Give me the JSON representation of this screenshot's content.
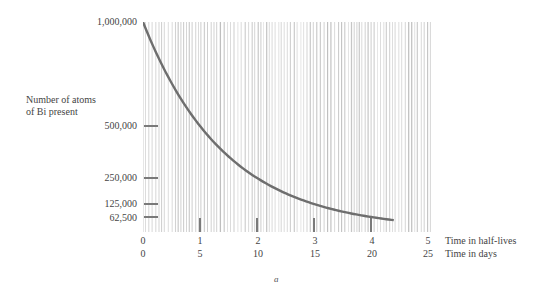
{
  "chart_data": {
    "type": "line",
    "title": "",
    "ylabel": "Number of atoms of Bi present",
    "ylabel_lines": [
      "Number of atoms",
      "of Bi present"
    ],
    "xlabel_primary": "Time in half-lives",
    "xlabel_secondary": "Time in days",
    "x_half_lives": [
      0,
      0.5,
      1,
      1.5,
      2,
      2.5,
      3,
      3.5,
      4,
      4.4
    ],
    "y_atoms": [
      1000000,
      707107,
      500000,
      353553,
      250000,
      176777,
      125000,
      88388,
      62500,
      47366
    ],
    "y_ticks": [
      {
        "value": 1000000,
        "label": "1,000,000"
      },
      {
        "value": 500000,
        "label": "500,000"
      },
      {
        "value": 250000,
        "label": "250,000"
      },
      {
        "value": 125000,
        "label": "125,000"
      },
      {
        "value": 62500,
        "label": "62,500"
      }
    ],
    "x_ticks_half_lives": [
      "0",
      "1",
      "2",
      "3",
      "4",
      "5"
    ],
    "x_ticks_days": [
      "0",
      "5",
      "10",
      "15",
      "20",
      "25"
    ],
    "xlim": [
      0,
      5
    ],
    "ylim": [
      0,
      1000000
    ],
    "grid": "vertical stripe shading",
    "legend": "none",
    "caption": "a",
    "colors": {
      "curve": "#6e6e6e",
      "stripes": "#bdbdbd",
      "ticks": "#7a7a7a"
    }
  }
}
